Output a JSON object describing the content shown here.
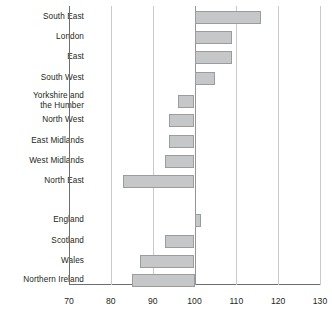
{
  "chart_data": {
    "type": "bar",
    "orientation": "horizontal",
    "title": "",
    "subtitle": "",
    "xlabel": "",
    "ylabel": "",
    "xlim": [
      70,
      130
    ],
    "xticks": [
      70,
      80,
      90,
      100,
      110,
      120,
      130
    ],
    "xtick_labels": [
      "70",
      "80",
      "90",
      "100",
      "110",
      "120",
      "130"
    ],
    "grid": true,
    "gridline_axis": "x",
    "baseline": 100,
    "legend": null,
    "categories": [
      "South East",
      "London",
      "East",
      "South West",
      "Yorkshire and\nthe Humber",
      "North West",
      "East Midlands",
      "West Midlands",
      "North East",
      "England",
      "Scotland",
      "Wales",
      "Northern Ireland"
    ],
    "values": [
      116,
      109,
      109,
      105,
      96,
      94,
      94,
      93,
      83,
      101.5,
      93,
      87,
      85
    ],
    "bar_color": "#c6c7c9",
    "bar_border_color": "#9b9c9e",
    "gridline_color": "#c9cacc",
    "axis_color": "#6d6e71"
  },
  "bars": [
    {
      "label": "South East",
      "value": 116,
      "top": 11,
      "gap_after": 0
    },
    {
      "label": "London",
      "value": 109,
      "top": 31,
      "gap_after": 0
    },
    {
      "label": "East",
      "value": 109,
      "top": 51,
      "gap_after": 0
    },
    {
      "label": "South West",
      "value": 105,
      "top": 72,
      "gap_after": 0
    },
    {
      "label": "Yorkshire and\nthe Humber",
      "value": 96,
      "top": 95,
      "gap_after": 0
    },
    {
      "label": "North West",
      "value": 94,
      "top": 114,
      "gap_after": 0
    },
    {
      "label": "East Midlands",
      "value": 94,
      "top": 135,
      "gap_after": 0
    },
    {
      "label": "West Midlands",
      "value": 93,
      "top": 155,
      "gap_after": 0
    },
    {
      "label": "North East",
      "value": 83,
      "top": 175,
      "gap_after": 1
    },
    {
      "label": "England",
      "value": 101.5,
      "top": 214,
      "gap_after": 0
    },
    {
      "label": "Scotland",
      "value": 93,
      "top": 235,
      "gap_after": 0
    },
    {
      "label": "Wales",
      "value": 87,
      "top": 255,
      "gap_after": 0
    },
    {
      "label": "Northern Ireland",
      "value": 85,
      "top": 274,
      "gap_after": 0
    }
  ],
  "axis": {
    "ticks": [
      "70",
      "80",
      "90",
      "100",
      "110",
      "120",
      "130"
    ],
    "min": 70,
    "max": 130,
    "baseline": 100
  },
  "labels": {
    "cat_0": "South East",
    "cat_1": "London",
    "cat_2": "East",
    "cat_3": "South West",
    "cat_4": "Yorkshire and\nthe Humber",
    "cat_5": "North West",
    "cat_6": "East Midlands",
    "cat_7": "West Midlands",
    "cat_8": "North East",
    "cat_9": "England",
    "cat_10": "Scotland",
    "cat_11": "Wales",
    "cat_12": "Northern Ireland"
  }
}
